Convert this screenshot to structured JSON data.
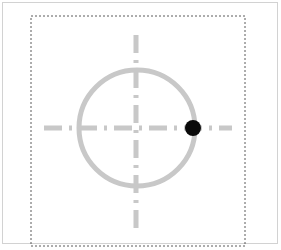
{
  "canvas": {
    "width": 281,
    "height": 250,
    "background_color": "#ffffff",
    "title": "Geometry Marker Canvas"
  },
  "frame": {
    "name": "outer-frame",
    "stroke_color": "#d2d2d2",
    "stroke_width": 1,
    "x": 2,
    "y": 2,
    "width": 276,
    "height": 242
  },
  "selection_box": {
    "name": "dashed-selection-rectangle",
    "stroke_color": "#5a5a5a",
    "stroke_width": 1,
    "dash_pattern": "2 2",
    "x": 31,
    "y": 16,
    "width": 214,
    "height": 230,
    "clipped_bottom": true
  },
  "circle": {
    "name": "construction-circle",
    "center_x": 137,
    "center_y": 128,
    "radius": 58,
    "stroke_color": "#c8c8c8",
    "stroke_width": 5,
    "fill": "none"
  },
  "crosshair": {
    "name": "center-crosshair",
    "stroke_color": "#c8c8c8",
    "stroke_width": 5,
    "dash_pattern": "18 7 3 7",
    "horizontal": {
      "x1": 44,
      "x2": 232,
      "y": 128
    },
    "vertical": {
      "x": 136,
      "y1": 35,
      "y2": 228
    }
  },
  "point_marker": {
    "name": "black-point-marker",
    "center_x": 193,
    "center_y": 128,
    "radius": 8,
    "fill_color": "#0a0a0a",
    "label": ""
  }
}
